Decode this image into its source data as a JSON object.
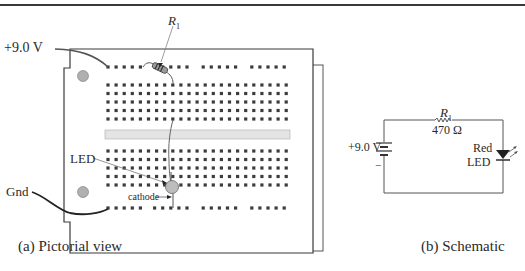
{
  "pictorial": {
    "supply_label": "+9.0 V",
    "ground_label": "Gnd",
    "resistor_label": "R",
    "resistor_subscript": "1",
    "led_label": "LED",
    "cathode_label": "cathode",
    "caption": "(a) Pictorial view"
  },
  "schematic": {
    "supply_label": "+9.0 V",
    "battery_minus": "−",
    "resistor_label": "R",
    "resistor_subscript": "1",
    "resistor_value": "470 Ω",
    "led_label_line1": "Red",
    "led_label_line2": "LED",
    "caption": "(b) Schematic"
  },
  "colors": {
    "line": "#3a3a3a",
    "hole": "#3c3c3c",
    "board": "#ffffff",
    "channel": "#e4e4e4",
    "mount_hole": "#b0b0b0",
    "led": "#bdbdbd"
  }
}
